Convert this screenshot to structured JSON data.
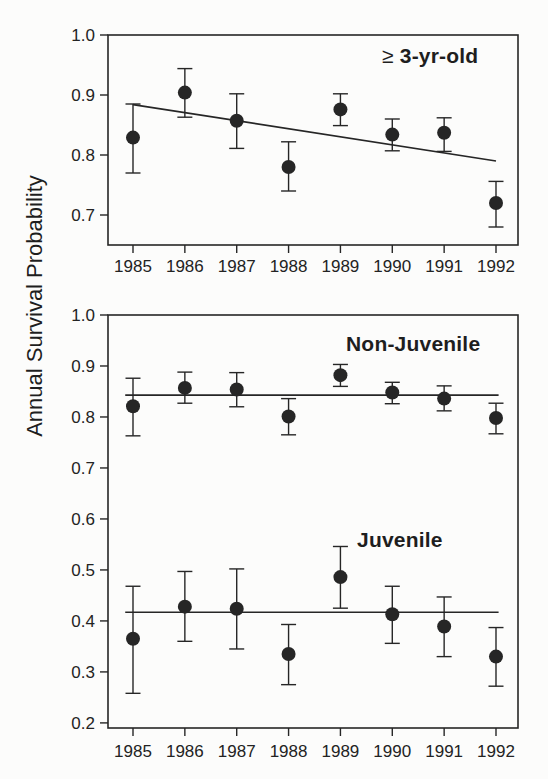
{
  "figure": {
    "ylabel": "Annual Survival Probability",
    "ink": "#262626",
    "background": "#fcfcfb"
  },
  "chart_data": [
    {
      "type": "scatter",
      "title": "≥ 3-yr-old",
      "title_symbol": "≥",
      "title_text": "3-yr-old",
      "x": [
        1985,
        1986,
        1987,
        1988,
        1989,
        1990,
        1991,
        1992
      ],
      "xlabel": "",
      "ylabel": "Annual Survival Probability",
      "ylim": [
        0.65,
        1.0
      ],
      "yticks": [
        0.7,
        0.8,
        0.9,
        1.0
      ],
      "grid": false,
      "series": [
        {
          "name": "≥ 3-yr-old",
          "marker": "filled-circle",
          "values": [
            0.829,
            0.904,
            0.857,
            0.78,
            0.876,
            0.834,
            0.837,
            0.72
          ],
          "ci_low": [
            0.77,
            0.863,
            0.811,
            0.74,
            0.849,
            0.807,
            0.806,
            0.68
          ],
          "ci_high": [
            0.885,
            0.944,
            0.902,
            0.822,
            0.902,
            0.86,
            0.862,
            0.756
          ],
          "fit_line": {
            "kind": "linear-trend",
            "x": [
              1985,
              1992
            ],
            "y": [
              0.884,
              0.79
            ]
          }
        }
      ]
    },
    {
      "type": "scatter",
      "title": "Non-Juvenile / Juvenile",
      "x": [
        1985,
        1986,
        1987,
        1988,
        1989,
        1990,
        1991,
        1992
      ],
      "xlabel": "",
      "ylabel": "Annual Survival Probability",
      "ylim": [
        0.19,
        1.0
      ],
      "yticks": [
        0.2,
        0.3,
        0.4,
        0.5,
        0.6,
        0.7,
        0.8,
        0.9,
        1.0
      ],
      "grid": false,
      "series": [
        {
          "name": "Non-Juvenile",
          "marker": "filled-circle",
          "values": [
            0.821,
            0.857,
            0.854,
            0.801,
            0.882,
            0.848,
            0.836,
            0.798
          ],
          "ci_low": [
            0.763,
            0.827,
            0.82,
            0.765,
            0.86,
            0.826,
            0.812,
            0.767
          ],
          "ci_high": [
            0.876,
            0.888,
            0.887,
            0.836,
            0.903,
            0.868,
            0.861,
            0.827
          ],
          "fit_line": {
            "kind": "constant-mean",
            "x": [
              1984.85,
              1992.05
            ],
            "y": [
              0.843,
              0.843
            ]
          }
        },
        {
          "name": "Juvenile",
          "marker": "filled-circle",
          "values": [
            0.365,
            0.428,
            0.424,
            0.335,
            0.486,
            0.413,
            0.389,
            0.33
          ],
          "ci_low": [
            0.258,
            0.36,
            0.345,
            0.275,
            0.425,
            0.356,
            0.33,
            0.272
          ],
          "ci_high": [
            0.468,
            0.497,
            0.502,
            0.393,
            0.546,
            0.468,
            0.447,
            0.387
          ],
          "fit_line": {
            "kind": "constant-mean",
            "x": [
              1984.85,
              1992.05
            ],
            "y": [
              0.417,
              0.417
            ]
          }
        }
      ]
    }
  ]
}
